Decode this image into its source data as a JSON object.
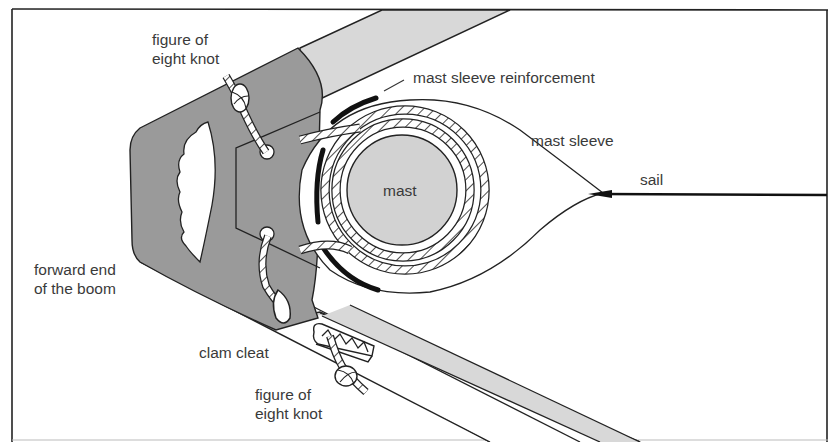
{
  "diagram": {
    "colors": {
      "frame": "#222222",
      "boom": "#d8d8d8",
      "collar": "#9a9a9a",
      "mast": "#d2d2d2",
      "reinforcement": "#111111",
      "text": "#3a3a3a"
    },
    "labels": {
      "figure_eight_top": "figure of\neight knot",
      "mast_sleeve_reinforcement": "mast sleeve reinforcement",
      "mast_sleeve": "mast sleeve",
      "sail": "sail",
      "mast": "mast",
      "forward_end_boom": "forward end\nof the boom",
      "clam_cleat": "clam cleat",
      "figure_eight_bottom": "figure of\neight knot"
    },
    "components": [
      {
        "id": "boom",
        "label": "forward end of the boom"
      },
      {
        "id": "mast",
        "label": "mast"
      },
      {
        "id": "mast-sleeve",
        "label": "mast sleeve"
      },
      {
        "id": "mast-sleeve-reinforcement",
        "label": "mast sleeve reinforcement"
      },
      {
        "id": "sail",
        "label": "sail"
      },
      {
        "id": "clam-cleat",
        "label": "clam cleat"
      },
      {
        "id": "figure-eight-knot-top",
        "label": "figure of eight knot"
      },
      {
        "id": "figure-eight-knot-bottom",
        "label": "figure of eight knot"
      }
    ]
  }
}
